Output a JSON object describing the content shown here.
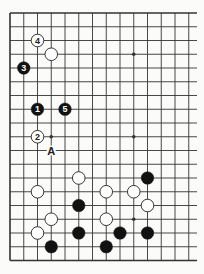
{
  "diagram": {
    "type": "go-board-fragment",
    "columns_visible": 14,
    "rows_visible": 19,
    "edges": {
      "left": true,
      "top": true,
      "bottom": true,
      "right": false
    },
    "colors": {
      "background": "#fbfbfa",
      "line": "#333333",
      "black_stone": "#111111",
      "white_stone": "#ffffff"
    },
    "hoshi": [
      [
        9,
        3
      ],
      [
        3,
        9
      ],
      [
        9,
        9
      ],
      [
        9,
        15
      ]
    ],
    "stones": [
      {
        "color": "white",
        "col": 2,
        "row": 2,
        "label": "4"
      },
      {
        "color": "white",
        "col": 3,
        "row": 3,
        "label": ""
      },
      {
        "color": "black",
        "col": 1,
        "row": 4,
        "label": "3"
      },
      {
        "color": "black",
        "col": 2,
        "row": 7,
        "label": "1"
      },
      {
        "color": "black",
        "col": 4,
        "row": 7,
        "label": "5"
      },
      {
        "color": "white",
        "col": 2,
        "row": 9,
        "label": "2"
      },
      {
        "color": "white",
        "col": 5,
        "row": 12,
        "label": ""
      },
      {
        "color": "black",
        "col": 10,
        "row": 12,
        "label": ""
      },
      {
        "color": "white",
        "col": 2,
        "row": 13,
        "label": ""
      },
      {
        "color": "white",
        "col": 7,
        "row": 13,
        "label": ""
      },
      {
        "color": "white",
        "col": 9,
        "row": 13,
        "label": ""
      },
      {
        "color": "black",
        "col": 5,
        "row": 14,
        "label": ""
      },
      {
        "color": "white",
        "col": 10,
        "row": 14,
        "label": ""
      },
      {
        "color": "white",
        "col": 3,
        "row": 15,
        "label": ""
      },
      {
        "color": "white",
        "col": 7,
        "row": 15,
        "label": ""
      },
      {
        "color": "white",
        "col": 2,
        "row": 16,
        "label": ""
      },
      {
        "color": "black",
        "col": 5,
        "row": 16,
        "label": ""
      },
      {
        "color": "black",
        "col": 8,
        "row": 16,
        "label": ""
      },
      {
        "color": "black",
        "col": 10,
        "row": 16,
        "label": ""
      },
      {
        "color": "black",
        "col": 3,
        "row": 17,
        "label": ""
      },
      {
        "color": "black",
        "col": 7,
        "row": 17,
        "label": ""
      }
    ],
    "markers": [
      {
        "col": 3,
        "row": 10,
        "label": "A"
      }
    ]
  }
}
